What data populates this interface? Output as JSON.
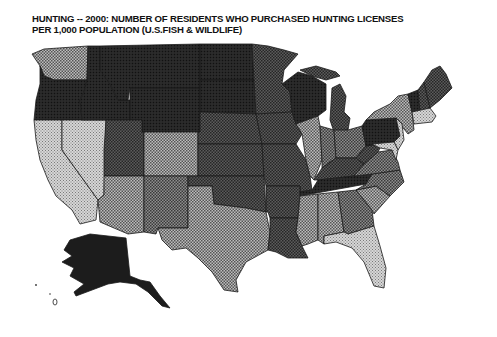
{
  "title": {
    "line1": "HUNTING -- 2000: NUMBER OF RESIDENTS WHO PURCHASED HUNTING LICENSES",
    "line2": "PER 1,000 POPULATION (U.S.FISH & WILDLIFE)"
  },
  "map": {
    "type": "choropleth",
    "region": "United States (with Alaska inset)",
    "shading_levels": {
      "level1_lightest": "#c9c9c9",
      "level2": "#a8a8a8",
      "level3": "#7d7d7d",
      "level4": "#555555",
      "level5_darkest": "#1e1e1e"
    },
    "states": {
      "WA": 2,
      "OR": 5,
      "CA": 1,
      "NV": 1,
      "ID": 5,
      "MT": 5,
      "WY": 5,
      "UT": 4,
      "AZ": 2,
      "CO": 2,
      "NM": 3,
      "ND": 5,
      "SD": 5,
      "NE": 4,
      "KS": 4,
      "OK": 4,
      "TX": 2,
      "MN": 4,
      "IA": 4,
      "MO": 4,
      "AR": 4,
      "LA": 4,
      "WI": 5,
      "IL": 2,
      "MI": 4,
      "IN": 3,
      "OH": 3,
      "KY": 4,
      "TN": 5,
      "MS": 2,
      "AL": 2,
      "GA": 3,
      "FL": 1,
      "SC": 2,
      "NC": 3,
      "VA": 3,
      "WV": 4,
      "PA": 5,
      "NY": 2,
      "NJ": 1,
      "DE": 1,
      "MD": 1,
      "CT": 1,
      "RI": 1,
      "MA": 1,
      "VT": 5,
      "NH": 4,
      "ME": 4,
      "AK": 5
    }
  }
}
